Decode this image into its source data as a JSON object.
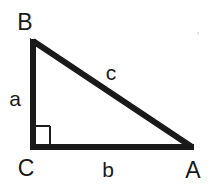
{
  "figure": {
    "kind": "right-triangle-diagram",
    "background_color": "#ffffff",
    "stroke_color": "#1a1a1a",
    "text_color": "#1a1a1a",
    "canvas": {
      "width": 217,
      "height": 190
    }
  },
  "geometry": {
    "stroke_width": 6,
    "right_angle_marker": {
      "present": true,
      "at_vertex": "C",
      "size": 17,
      "stroke_width": 2
    },
    "vertices": [
      {
        "name": "B",
        "x": 33,
        "y": 41
      },
      {
        "name": "C",
        "x": 33,
        "y": 147
      },
      {
        "name": "A",
        "x": 192,
        "y": 147
      }
    ],
    "edges": [
      {
        "name": "a",
        "from": "B",
        "to": "C",
        "role": "vertical-leg"
      },
      {
        "name": "b",
        "from": "C",
        "to": "A",
        "role": "horizontal-leg"
      },
      {
        "name": "c",
        "from": "B",
        "to": "A",
        "role": "hypotenuse"
      }
    ]
  },
  "labels": {
    "vertex_B": "B",
    "vertex_C": "C",
    "vertex_A": "A",
    "side_a": "a",
    "side_b": "b",
    "side_c": "c"
  }
}
